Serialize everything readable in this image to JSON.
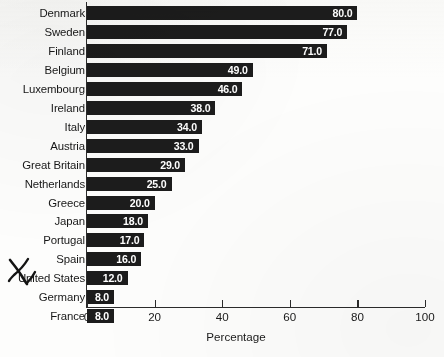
{
  "chart_data": {
    "type": "bar",
    "orientation": "horizontal",
    "title": "",
    "xlabel": "Percentage",
    "ylabel": "",
    "xlim": [
      0,
      100
    ],
    "xticks": [
      0,
      20,
      40,
      60,
      80,
      100
    ],
    "grid": false,
    "legend": null,
    "categories": [
      "Denmark",
      "Sweden",
      "Finland",
      "Belgium",
      "Luxembourg",
      "Ireland",
      "Italy",
      "Austria",
      "Great Britain",
      "Netherlands",
      "Greece",
      "Japan",
      "Portugal",
      "Spain",
      "United States",
      "Germany",
      "France"
    ],
    "values": [
      80.0,
      77.0,
      71.0,
      49.0,
      46.0,
      38.0,
      34.0,
      33.0,
      29.0,
      25.0,
      20.0,
      18.0,
      17.0,
      16.0,
      12.0,
      8.0,
      8.0
    ],
    "value_labels": [
      "80.0",
      "77.0",
      "71.0",
      "49.0",
      "46.0",
      "38.0",
      "34.0",
      "33.0",
      "29.0",
      "25.0",
      "20.0",
      "18.0",
      "17.0",
      "16.0",
      "12.0",
      "8.0",
      "8.0"
    ],
    "bar_color": "#1c1c1c",
    "value_label_color": "#ffffff",
    "background_color": "#fdfdfc"
  },
  "annotations": [
    {
      "name": "handwritten-check-mark",
      "target_category": "United States",
      "description": "hand-drawn ink check/X mark to the left of the United States label"
    }
  ],
  "axis": {
    "tick_labels": [
      "0",
      "20",
      "40",
      "60",
      "80",
      "100"
    ],
    "title": "Percentage"
  }
}
